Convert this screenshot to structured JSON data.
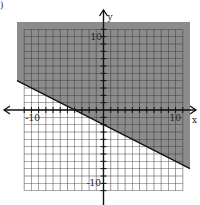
{
  "chart_data": {
    "type": "line",
    "title": "",
    "subtitle": "Graph of linear inequality",
    "xlabel": "x",
    "ylabel": "y",
    "xlim": [
      -12,
      12
    ],
    "ylim": [
      -12,
      12
    ],
    "grid": true,
    "tick_labels": {
      "x": [
        "-10",
        "10"
      ],
      "y": [
        "10",
        "-10"
      ]
    },
    "boundary_line": {
      "slope": -0.5,
      "intercept": -2,
      "style": "solid",
      "points": [
        [
          -12,
          4
        ],
        [
          12,
          -8
        ]
      ]
    },
    "inequality": "y >= -1/2 x - 2",
    "shaded_region": "above",
    "colors": {
      "shade": "#8c8c8c",
      "grid": "#333333",
      "axis": "#111111",
      "background": "#ffffff"
    }
  },
  "labels": {
    "x_axis": "x",
    "y_axis": "y",
    "x_neg": "-10",
    "x_pos": "10",
    "y_pos": "10",
    "y_neg": "-10",
    "corner_mark": ")"
  }
}
